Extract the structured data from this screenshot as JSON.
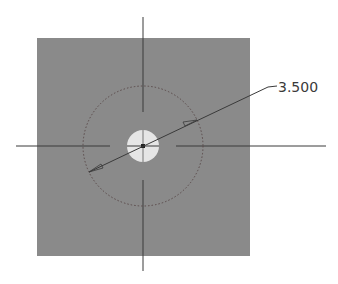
{
  "diagram": {
    "type": "cad-sketch",
    "plate": {
      "x": 37,
      "y": 38,
      "width": 213,
      "height": 218,
      "color": "#8a8a8a"
    },
    "hole": {
      "cx": 143,
      "cy": 146,
      "r": 16,
      "color": "#e6e6e6"
    },
    "reference_circle": {
      "cx": 143,
      "cy": 146,
      "r": 60,
      "style": "dotted",
      "color": "#5a4a4a"
    },
    "centerlines": {
      "color": "#3a3a3a"
    },
    "dimension": {
      "label": "3.500",
      "kind": "diameter",
      "color": "#3a3a3a"
    }
  }
}
